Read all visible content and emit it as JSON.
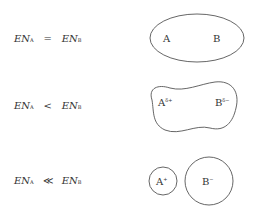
{
  "rows": [
    {
      "left": {
        "symbol": "EN",
        "subscript": "A"
      },
      "operator": "=",
      "right": {
        "symbol": "EN",
        "subscript": "B"
      },
      "diagram": {
        "type": "single-ellipse",
        "atom_a": "A",
        "atom_b": "B",
        "charge_a": "",
        "charge_b": ""
      }
    },
    {
      "left": {
        "symbol": "EN",
        "subscript": "A"
      },
      "operator": "<",
      "right": {
        "symbol": "EN",
        "subscript": "B"
      },
      "diagram": {
        "type": "polarized-blob",
        "atom_a": "A",
        "atom_b": "B",
        "charge_a": "δ+",
        "charge_b": "δ−"
      }
    },
    {
      "left": {
        "symbol": "EN",
        "subscript": "A"
      },
      "operator": "≪",
      "right": {
        "symbol": "EN",
        "subscript": "B"
      },
      "diagram": {
        "type": "two-ions",
        "atom_a": "A",
        "atom_b": "B",
        "charge_a": "+",
        "charge_b": "−"
      }
    }
  ],
  "stroke_color": "#555555"
}
